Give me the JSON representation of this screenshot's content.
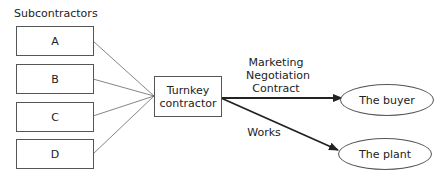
{
  "diagram": {
    "group_label": "Subcontractors",
    "subcontractors": [
      {
        "label": "A"
      },
      {
        "label": "B"
      },
      {
        "label": "C"
      },
      {
        "label": "D"
      }
    ],
    "hub": {
      "line1": "Turnkey",
      "line2": "contractor"
    },
    "edges": [
      {
        "label_lines": [
          "Marketing",
          "Negotiation",
          "Contract"
        ],
        "target": "The buyer"
      },
      {
        "label_lines": [
          "Works"
        ],
        "target": "The plant"
      }
    ],
    "targets": [
      {
        "label": "The buyer"
      },
      {
        "label": "The plant"
      }
    ]
  }
}
